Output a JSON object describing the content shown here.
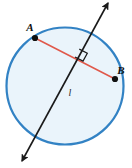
{
  "figure": {
    "canvas": {
      "width": 132,
      "height": 168
    },
    "background_color": "#ffffff"
  },
  "circle": {
    "name": "circle",
    "center": {
      "x": 65,
      "y": 86
    },
    "radius": 58.5,
    "stroke_color": "#3282c4",
    "stroke_width": 2.2,
    "fill_color": "#eaf4fb"
  },
  "points": [
    {
      "id": "A",
      "label": "A",
      "x": 35,
      "y": 38,
      "dot_radius": 3.1,
      "dot_color": "#101010",
      "label_x": 30,
      "label_y": 31,
      "label_anchor": "middle"
    },
    {
      "id": "B",
      "label": "B",
      "x": 115,
      "y": 79,
      "dot_radius": 3.1,
      "dot_color": "#101010",
      "label_x": 121,
      "label_y": 74,
      "label_anchor": "middle"
    }
  ],
  "chord": {
    "name": "chord-ab",
    "from": {
      "x": 35,
      "y": 38
    },
    "to": {
      "x": 115,
      "y": 79
    },
    "stroke_color": "#e0584a",
    "stroke_width": 1.5
  },
  "line": {
    "name": "line-l",
    "label": "l",
    "label_x": 70,
    "label_y": 96,
    "from": {
      "x": 108,
      "y": 3
    },
    "to": {
      "x": 22,
      "y": 161
    },
    "stroke_color": "#1a1a1a",
    "stroke_width": 1.6,
    "arrowheads": "both"
  },
  "right_angle": {
    "name": "right-angle-mark",
    "vertex": {
      "x": 75,
      "y": 57
    },
    "size": 9,
    "stroke_color": "#1a1a1a",
    "stroke_width": 1.2
  },
  "colors": {
    "circle_blue": "#3282c4",
    "chord_red": "#e0584a",
    "line_black": "#1a1a1a",
    "circle_fill": "#eaf4fb"
  }
}
